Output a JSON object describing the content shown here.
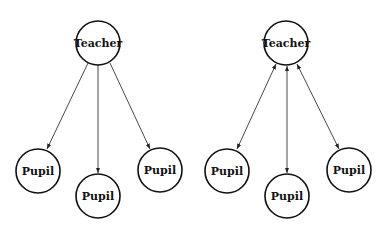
{
  "diagrams": [
    {
      "name": "one-way",
      "teacher": {
        "label": "Teacher",
        "x": 98,
        "y": 43
      },
      "pupils": [
        {
          "label": "Pupil",
          "x": 38,
          "y": 171
        },
        {
          "label": "Pupil",
          "x": 98,
          "y": 196
        },
        {
          "label": "Pupil",
          "x": 160,
          "y": 170
        }
      ],
      "direction": "teacher-to-pupil"
    },
    {
      "name": "two-way",
      "teacher": {
        "label": "Teacher",
        "x": 286,
        "y": 43
      },
      "pupils": [
        {
          "label": "Pupil",
          "x": 227,
          "y": 171
        },
        {
          "label": "Pupil",
          "x": 287,
          "y": 196
        },
        {
          "label": "Pupil",
          "x": 349,
          "y": 170
        }
      ],
      "direction": "bidirectional"
    }
  ],
  "colors": {
    "stroke": "#111111",
    "background": "#ffffff"
  }
}
